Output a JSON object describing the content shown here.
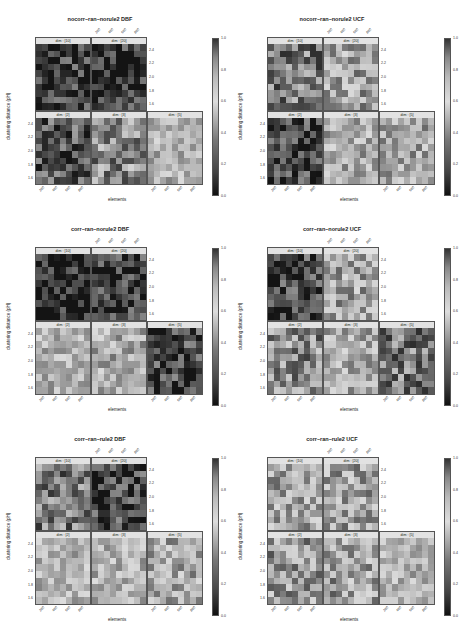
{
  "page": {
    "page_number": ""
  },
  "chart_data": [
    {
      "type": "heatmap",
      "title": "nocorr–ran–norule2 DBF",
      "xlabel": "elements",
      "ylabel": "clustering distance (pH)",
      "panels": [
        "dim : [10]",
        "dim : [20]",
        "dim : [2]",
        "dim : [3]",
        "dim : [5]"
      ],
      "yticks": [
        "1.6",
        "1.8",
        "2.0",
        "2.2",
        "2.4"
      ],
      "xticks": [
        "200",
        "400",
        "600",
        "800"
      ],
      "colorbar": {
        "ticks": [
          "0.0",
          "0.2",
          "0.4",
          "0.6",
          "0.8",
          "1.0"
        ],
        "range": [
          0,
          1
        ]
      },
      "panel_means": {
        "dim10": 0.12,
        "dim20": 0.1,
        "dim2": 0.2,
        "dim3": 0.35,
        "dim5": 0.55
      }
    },
    {
      "type": "heatmap",
      "title": "nocorr–ran–norule2 UCF",
      "xlabel": "elements",
      "ylabel": "clustering distance (pH)",
      "panels": [
        "dim : [10]",
        "dim : [20]",
        "dim : [2]",
        "dim : [3]",
        "dim : [5]"
      ],
      "yticks": [
        "1.6",
        "1.8",
        "2.0",
        "2.2",
        "2.4"
      ],
      "xticks": [
        "200",
        "400",
        "600",
        "800"
      ],
      "colorbar": {
        "ticks": [
          "0.0",
          "0.2",
          "0.4",
          "0.6",
          "0.8",
          "1.0"
        ],
        "range": [
          0,
          1
        ]
      },
      "panel_means": {
        "dim10": 0.3,
        "dim20": 0.45,
        "dim2": 0.15,
        "dim3": 0.5,
        "dim5": 0.65
      }
    },
    {
      "type": "heatmap",
      "title": "corr–ran–norule2 DBF",
      "xlabel": "elements",
      "ylabel": "clustering distance (pH)",
      "panels": [
        "dim : [10]",
        "dim : [20]",
        "dim : [2]",
        "dim : [3]",
        "dim : [5]"
      ],
      "yticks": [
        "1.6",
        "1.8",
        "2.0",
        "2.2",
        "2.4"
      ],
      "xticks": [
        "200",
        "400",
        "600",
        "800"
      ],
      "colorbar": {
        "ticks": [
          "0.0",
          "0.2",
          "0.4",
          "0.6",
          "0.8",
          "1.0"
        ],
        "range": [
          0,
          1
        ]
      },
      "panel_means": {
        "dim10": 0.05,
        "dim20": 0.12,
        "dim2": 0.55,
        "dim3": 0.5,
        "dim5": 0.15
      }
    },
    {
      "type": "heatmap",
      "title": "corr–ran–norule2 UCF",
      "xlabel": "elements",
      "ylabel": "clustering distance (pH)",
      "panels": [
        "dim : [10]",
        "dim : [20]",
        "dim : [2]",
        "dim : [3]",
        "dim : [5]"
      ],
      "yticks": [
        "1.6",
        "1.8",
        "2.0",
        "2.2",
        "2.4"
      ],
      "xticks": [
        "200",
        "400",
        "600",
        "800"
      ],
      "colorbar": {
        "ticks": [
          "0.0",
          "0.2",
          "0.4",
          "0.6",
          "0.8",
          "1.0"
        ],
        "range": [
          0,
          1
        ]
      },
      "panel_means": {
        "dim10": 0.15,
        "dim20": 0.45,
        "dim2": 0.35,
        "dim3": 0.5,
        "dim5": 0.3
      }
    },
    {
      "type": "heatmap",
      "title": "corr–ran–rule2 DBF",
      "xlabel": "elements",
      "ylabel": "clustering distance (pH)",
      "panels": [
        "dim : [10]",
        "dim : [20]",
        "dim : [2]",
        "dim : [3]",
        "dim : [5]"
      ],
      "yticks": [
        "1.6",
        "1.8",
        "2.0",
        "2.2",
        "2.4"
      ],
      "xticks": [
        "200",
        "400",
        "600",
        "800"
      ],
      "colorbar": {
        "ticks": [
          "0.0",
          "0.2",
          "0.4",
          "0.6",
          "0.8",
          "1.0"
        ],
        "range": [
          0,
          1
        ]
      },
      "panel_means": {
        "dim10": 0.3,
        "dim20": 0.15,
        "dim2": 0.55,
        "dim3": 0.6,
        "dim5": 0.65
      }
    },
    {
      "type": "heatmap",
      "title": "corr–ran–rule2 UCF",
      "xlabel": "elements",
      "ylabel": "clustering distance (pH)",
      "panels": [
        "dim : [10]",
        "dim : [20]",
        "dim : [2]",
        "dim : [3]",
        "dim : [5]"
      ],
      "yticks": [
        "1.6",
        "1.8",
        "2.0",
        "2.2",
        "2.4"
      ],
      "xticks": [
        "200",
        "400",
        "600",
        "800"
      ],
      "colorbar": {
        "ticks": [
          "0.0",
          "0.2",
          "0.4",
          "0.6",
          "0.8",
          "1.0"
        ],
        "range": [
          0,
          1
        ]
      },
      "panel_means": {
        "dim10": 0.45,
        "dim20": 0.45,
        "dim2": 0.4,
        "dim3": 0.7,
        "dim5": 0.55
      }
    }
  ]
}
